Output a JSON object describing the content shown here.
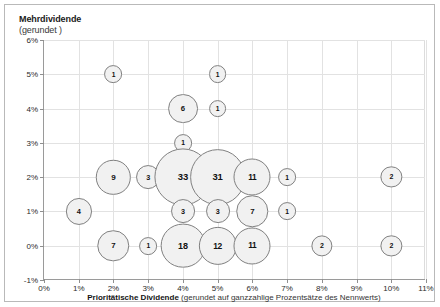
{
  "chart_data": {
    "type": "scatter",
    "subtype": "bubble",
    "title": "",
    "ylabel": "Mehrdividende",
    "ylabel_sub": "(gerundet )",
    "xlabel_bold": "Prioritätische Dividende",
    "xlabel_rest": " (gerundet auf ganzzahlige Prozentsätze des Nennwerts)",
    "xlim": [
      0,
      11
    ],
    "ylim": [
      -1,
      6
    ],
    "xticks": [
      "0%",
      "1%",
      "2%",
      "3%",
      "4%",
      "5%",
      "6%",
      "7%",
      "8%",
      "9%",
      "10%",
      "11%"
    ],
    "xtick_values": [
      0,
      1,
      2,
      3,
      4,
      5,
      6,
      7,
      8,
      9,
      10,
      11
    ],
    "yticks": [
      "6%",
      "5%",
      "4%",
      "3%",
      "2%",
      "1%",
      "0%",
      "-1%"
    ],
    "ytick_values": [
      6,
      5,
      4,
      3,
      2,
      1,
      0,
      -1
    ],
    "grid": true,
    "legend": "none",
    "bubble_fill": "#f1f1f1",
    "bubble_stroke": "#808080",
    "points": [
      {
        "x": 2,
        "y": 5,
        "value": 1,
        "label": "1"
      },
      {
        "x": 5,
        "y": 5,
        "value": 1,
        "label": "1"
      },
      {
        "x": 4,
        "y": 4,
        "value": 6,
        "label": "6"
      },
      {
        "x": 5,
        "y": 4,
        "value": 1,
        "label": "1"
      },
      {
        "x": 4,
        "y": 3,
        "value": 1,
        "label": "1"
      },
      {
        "x": 2,
        "y": 2,
        "value": 9,
        "label": "9"
      },
      {
        "x": 3,
        "y": 2,
        "value": 3,
        "label": "3"
      },
      {
        "x": 4,
        "y": 2,
        "value": 33,
        "label": "33"
      },
      {
        "x": 5,
        "y": 2,
        "value": 31,
        "label": "31"
      },
      {
        "x": 6,
        "y": 2,
        "value": 11,
        "label": "11"
      },
      {
        "x": 7,
        "y": 2,
        "value": 1,
        "label": "1"
      },
      {
        "x": 10,
        "y": 2,
        "value": 2,
        "label": "2"
      },
      {
        "x": 1,
        "y": 1,
        "value": 4,
        "label": "4"
      },
      {
        "x": 4,
        "y": 1,
        "value": 3,
        "label": "3"
      },
      {
        "x": 5,
        "y": 1,
        "value": 3,
        "label": "3"
      },
      {
        "x": 6,
        "y": 1,
        "value": 7,
        "label": "7"
      },
      {
        "x": 7,
        "y": 1,
        "value": 1,
        "label": "1"
      },
      {
        "x": 2,
        "y": 0,
        "value": 7,
        "label": "7"
      },
      {
        "x": 3,
        "y": 0,
        "value": 1,
        "label": "1"
      },
      {
        "x": 4,
        "y": 0,
        "value": 18,
        "label": "18"
      },
      {
        "x": 5,
        "y": 0,
        "value": 12,
        "label": "12"
      },
      {
        "x": 6,
        "y": 0,
        "value": 11,
        "label": "11"
      },
      {
        "x": 8,
        "y": 0,
        "value": 2,
        "label": "2"
      },
      {
        "x": 10,
        "y": 0,
        "value": 2,
        "label": "2"
      }
    ]
  }
}
